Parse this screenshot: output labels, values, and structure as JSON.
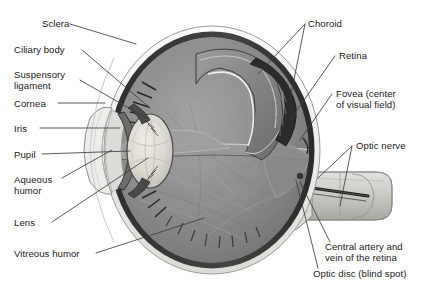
{
  "figure": {
    "type": "anatomical-diagram",
    "background_color": "#ffffff",
    "text_color": "#1a1a1a",
    "leader_line_color": "#3c3c3c"
  },
  "labels": {
    "sclera": "Sclera",
    "ciliary_body": "Ciliary body",
    "suspensory_ligament_line1": "Suspensory",
    "suspensory_ligament_line2": "ligament",
    "cornea": "Cornea",
    "iris": "Iris",
    "pupil": "Pupil",
    "aqueous_humor_line1": "Aqueous",
    "aqueous_humor_line2": "humor",
    "lens": "Lens",
    "vitreous_humor": "Vitreous humor",
    "choroid": "Choroid",
    "retina": "Retina",
    "fovea_line1": "Fovea (center",
    "fovea_line2": "of visual field)",
    "optic_nerve": "Optic nerve",
    "central_artery_line1": "Central artery and",
    "central_artery_line2": "vein of the retina",
    "optic_disc": "Optic disc (blind spot)"
  },
  "structures": {
    "sclera_tone": "#f2f2f0",
    "choroid_tone": "#3b3b3b",
    "retina_tone": "#6e6e6e",
    "vitreous_tone": "#8c8c8c",
    "lens_tone": "#d8d6cf",
    "cornea_tone": "#e8e8e6",
    "optic_nerve_tone": "#cfcfcb"
  },
  "colors": {
    "ink": "#1a1a1a",
    "leader": "#3c3c3c",
    "white": "#ffffff"
  }
}
